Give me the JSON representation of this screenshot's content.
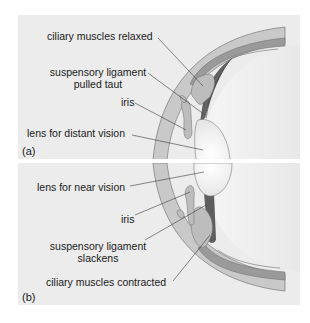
{
  "figure": {
    "type": "diagram",
    "colors": {
      "panel_bg": "#ececec",
      "sclera": "#c9c9c9",
      "choroid": "#9a9a9a",
      "ciliary_muscle": "#bdbdbd",
      "ligament": "#5e5e5e",
      "lens": "#f4f4f4",
      "line": "#3a3a3a"
    }
  },
  "panel_a": {
    "letter": "(a)",
    "labels": {
      "ciliary": "ciliary muscles relaxed",
      "ligament_line1": "suspensory ligament",
      "ligament_line2": "pulled taut",
      "iris": "iris",
      "lens": "lens for distant vision"
    }
  },
  "panel_b": {
    "letter": "(b)",
    "labels": {
      "lens": "lens for near vision",
      "iris": "iris",
      "ligament_line1": "suspensory ligament",
      "ligament_line2": "slackens",
      "ciliary": "ciliary muscles contracted"
    }
  }
}
